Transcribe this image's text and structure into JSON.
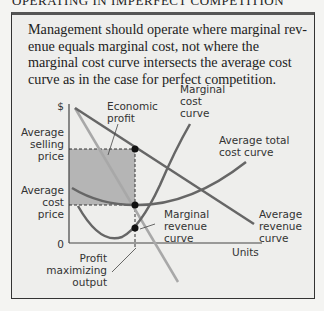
{
  "header": {
    "title": "OPERATING IN IMPERFECT COMPETITION"
  },
  "caption": "Management should operate where marginal rev-enue equals marginal cost, not where the marginal cost curve intersects the average cost curve as in the case for perfect competition.",
  "diagram": {
    "y_axis_label": "$",
    "x_axis_label": "Units",
    "origin_label": "0",
    "labels": {
      "average_selling_price": [
        "Average",
        "selling",
        "price"
      ],
      "average_cost_price": [
        "Average",
        "cost",
        "price"
      ],
      "economic_profit": [
        "Economic",
        "profit"
      ],
      "marginal_cost_curve": [
        "Marginal",
        "cost",
        "curve"
      ],
      "average_total_cost_curve": [
        "Average total",
        "cost curve"
      ],
      "marginal_revenue_curve": [
        "Marginal",
        "revenue",
        "curve"
      ],
      "average_revenue_curve": [
        "Average",
        "revenue",
        "curve"
      ],
      "profit_maximizing_output": [
        "Profit",
        "maximizing",
        "output"
      ]
    },
    "colors": {
      "curve": "#666666",
      "mr_curve": "#a8a8a8",
      "shade": "#b5b5b5",
      "dot": "#111111"
    }
  }
}
